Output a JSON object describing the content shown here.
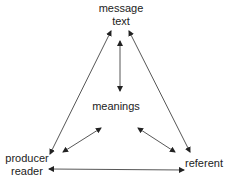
{
  "diagram": {
    "nodes": {
      "top": {
        "line1": "message",
        "line2": "text"
      },
      "center": {
        "label": "meanings"
      },
      "bottom_left": {
        "line1": "producer",
        "line2": "reader"
      },
      "bottom_right": {
        "label": "referent"
      }
    },
    "edges": [
      {
        "from": "producer/reader",
        "to": "message/text",
        "type": "double-arrow"
      },
      {
        "from": "referent",
        "to": "message/text",
        "type": "double-arrow"
      },
      {
        "from": "meanings",
        "to": "message/text",
        "type": "double-arrow"
      },
      {
        "from": "meanings",
        "to": "producer/reader",
        "type": "double-arrow"
      },
      {
        "from": "meanings",
        "to": "referent",
        "type": "double-arrow"
      },
      {
        "from": "producer/reader",
        "to": "referent",
        "type": "double-arrow"
      }
    ],
    "colors": {
      "line": "#333333",
      "text": "#222222",
      "background": "#ffffff"
    }
  }
}
